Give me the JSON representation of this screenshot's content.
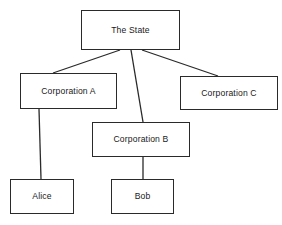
{
  "diagram": {
    "type": "hierarchy-tree",
    "background_color": "#ffffff",
    "line_color": "#2a2a2a",
    "text_color": "#1a1a1a",
    "nodes": [
      {
        "id": "state",
        "label": "The State"
      },
      {
        "id": "corp_a",
        "label": "Corporation A"
      },
      {
        "id": "corp_b",
        "label": "Corporation B"
      },
      {
        "id": "corp_c",
        "label": "Corporation C"
      },
      {
        "id": "alice",
        "label": "Alice"
      },
      {
        "id": "bob",
        "label": "Bob"
      }
    ],
    "edges": [
      {
        "from": "state",
        "to": "corp_a"
      },
      {
        "from": "state",
        "to": "corp_b"
      },
      {
        "from": "state",
        "to": "corp_c"
      },
      {
        "from": "corp_a",
        "to": "alice"
      },
      {
        "from": "corp_b",
        "to": "bob"
      }
    ]
  }
}
